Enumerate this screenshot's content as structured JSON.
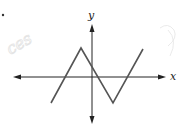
{
  "chart_data": {
    "type": "line",
    "title": "",
    "xlabel": "x",
    "ylabel": "y",
    "grid": false,
    "legend": null,
    "tick_labels": [],
    "series": [
      {
        "name": "f(x)",
        "points_pixel": [
          [
            51,
            103
          ],
          [
            81,
            48
          ],
          [
            113,
            103
          ],
          [
            143,
            49
          ]
        ],
        "points_relative": [
          [
            -3,
            -2.1
          ],
          [
            -0.9,
            2.2
          ],
          [
            1.6,
            -2.1
          ],
          [
            3.9,
            2.2
          ]
        ]
      }
    ],
    "x_intercepts_relative": [
      -1.8,
      0.3,
      2.9
    ],
    "axes": {
      "x_axis": {
        "y": 77,
        "x_from": 13,
        "x_to": 166,
        "arrows": "both"
      },
      "y_axis": {
        "x": 92,
        "y_from": 24,
        "y_to": 124,
        "arrows": "both"
      }
    },
    "colors": {
      "curve": "#555555",
      "axes": "#222222"
    }
  },
  "labels": {
    "x_axis": "x",
    "y_axis": "y",
    "bullet": "."
  }
}
